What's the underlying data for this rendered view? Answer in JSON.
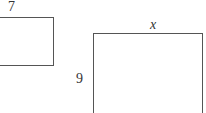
{
  "diagram": {
    "shapes": [
      {
        "id": "rect-small",
        "label_top": "7",
        "label_left": null
      },
      {
        "id": "rect-large",
        "label_top": "x",
        "label_left": "9"
      }
    ],
    "colors": {
      "stroke": "#555555",
      "text": "#333333",
      "background": "#ffffff"
    }
  }
}
